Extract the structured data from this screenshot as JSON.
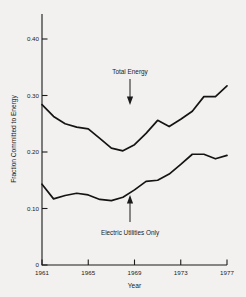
{
  "chart_data": {
    "type": "line",
    "title": "",
    "xlabel": "Year",
    "ylabel": "Fraction Committed to Energy",
    "xlim": [
      1961,
      1977
    ],
    "ylim": [
      0,
      0.44
    ],
    "grid": false,
    "legend_position": "inline-annotations",
    "x": [
      1961,
      1962,
      1963,
      1964,
      1965,
      1966,
      1967,
      1968,
      1969,
      1970,
      1971,
      1972,
      1973,
      1974,
      1975,
      1976,
      1977
    ],
    "xticks": [
      "1961",
      "1965",
      "1969",
      "1973",
      "1977"
    ],
    "xtick_values": [
      1961,
      1965,
      1969,
      1973,
      1977
    ],
    "yticks": [
      "0",
      "0.10",
      "0.20",
      "0.30",
      "0.40"
    ],
    "ytick_values": [
      0,
      0.1,
      0.2,
      0.3,
      0.4
    ],
    "series": [
      {
        "name": "Total Energy",
        "values": [
          0.284,
          0.263,
          0.25,
          0.243,
          0.24,
          0.225,
          0.208,
          0.203,
          0.213,
          0.232,
          0.255,
          0.245,
          0.258,
          0.272,
          0.298,
          0.298,
          0.317
        ]
      },
      {
        "name": "Electric Utilities Only",
        "values": [
          0.143,
          0.117,
          0.123,
          0.127,
          0.124,
          0.116,
          0.114,
          0.12,
          0.133,
          0.148,
          0.15,
          0.16,
          0.178,
          0.196,
          0.196,
          0.188,
          0.194
        ]
      }
    ],
    "annotations": [
      {
        "label": "Total Energy",
        "series": "Total Energy",
        "arrow": "down",
        "at_x": 1969
      },
      {
        "label": "Electric Utilities Only",
        "series": "Electric Utilities Only",
        "arrow": "up",
        "at_x": 1969
      }
    ]
  },
  "upper_series_points": [
    [
      1961,
      0.284
    ],
    [
      1962,
      0.263
    ],
    [
      1963,
      0.25
    ],
    [
      1964,
      0.244
    ],
    [
      1965,
      0.241
    ],
    [
      1966,
      0.224
    ],
    [
      1967,
      0.207
    ],
    [
      1968,
      0.202
    ],
    [
      1969,
      0.213
    ],
    [
      1970,
      0.233
    ],
    [
      1971,
      0.256
    ],
    [
      1972,
      0.245
    ],
    [
      1973,
      0.258
    ],
    [
      1974,
      0.272
    ],
    [
      1975,
      0.298
    ],
    [
      1976,
      0.298
    ],
    [
      1977,
      0.317
    ]
  ],
  "lower_series_points": [
    [
      1961,
      0.143
    ],
    [
      1962,
      0.117
    ],
    [
      1963,
      0.123
    ],
    [
      1964,
      0.127
    ],
    [
      1965,
      0.124
    ],
    [
      1966,
      0.116
    ],
    [
      1967,
      0.114
    ],
    [
      1968,
      0.12
    ],
    [
      1969,
      0.133
    ],
    [
      1970,
      0.148
    ],
    [
      1971,
      0.15
    ],
    [
      1972,
      0.161
    ],
    [
      1973,
      0.178
    ],
    [
      1974,
      0.196
    ],
    [
      1975,
      0.196
    ],
    [
      1976,
      0.188
    ],
    [
      1977,
      0.194
    ]
  ],
  "axis": {
    "y_title": "Fraction Committed to Energy",
    "x_title": "Year"
  },
  "annotations": {
    "total_energy": "Total Energy",
    "electric_utilities": "Electric Utilities Only"
  },
  "colors": {
    "line": "#141414",
    "axis": "#1b1b1b",
    "background": "#f2f1ef"
  }
}
